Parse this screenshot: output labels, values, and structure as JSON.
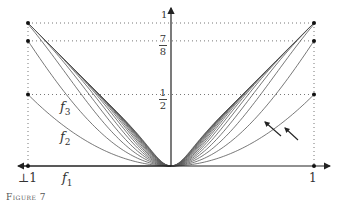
{
  "figure": {
    "caption": "Figure 7",
    "x_ticks": {
      "left": "⊥1",
      "right": "1"
    },
    "y_ticks": {
      "one": "1",
      "seven_eighths": {
        "num": "7",
        "den": "8"
      },
      "half": {
        "num": "1",
        "den": "2"
      }
    },
    "curve_labels": {
      "f1": {
        "name": "f",
        "sub": "1"
      },
      "f2": {
        "name": "f",
        "sub": "2"
      },
      "f3": {
        "name": "f",
        "sub": "3"
      }
    },
    "colors": {
      "curve": "#555555",
      "axis": "#222222",
      "grid": "#777777",
      "point": "#111111"
    }
  },
  "chart_data": {
    "type": "line",
    "title": "",
    "caption": "Figure 7",
    "xlabel": "",
    "ylabel": "",
    "xlim": [
      -1,
      1
    ],
    "ylim": [
      0,
      1
    ],
    "x_tick_labels": [
      "⊥1",
      "1"
    ],
    "y_tick_labels": [
      "1/2",
      "7/8",
      "1"
    ],
    "grid": "dotted guide lines at y = 1/2, 7/8, 1 and x = ±1",
    "recurrence": "f1(x)=0, f_{n+1}(x) = f_n(x) + (x^2 - f_n(x)^2)/2, converging to |x|",
    "x": [
      -1,
      -0.75,
      -0.5,
      -0.25,
      0,
      0.25,
      0.5,
      0.75,
      1
    ],
    "series": [
      {
        "name": "f1",
        "values": [
          0,
          0,
          0,
          0,
          0,
          0,
          0,
          0,
          0
        ]
      },
      {
        "name": "f2",
        "values": [
          0.5,
          0.281,
          0.125,
          0.031,
          0,
          0.031,
          0.125,
          0.281,
          0.5
        ]
      },
      {
        "name": "f3",
        "values": [
          0.875,
          0.523,
          0.242,
          0.062,
          0,
          0.062,
          0.242,
          0.523,
          0.875
        ]
      }
    ],
    "endpoint_values": [
      0,
      0.5,
      0.875,
      1
    ],
    "annotations": [
      "two arrows pointing toward curves near x ≈ 0.8",
      "labels f1, f2, f3 on left side"
    ]
  }
}
